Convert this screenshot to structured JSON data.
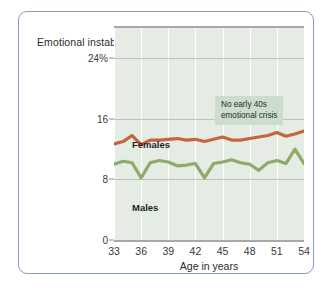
{
  "chart_data": {
    "type": "line",
    "title": "",
    "ylabel": "Emotional\ninstability",
    "xlabel": "Age in years",
    "xlim": [
      33,
      54
    ],
    "ylim": [
      0,
      28
    ],
    "yticks": [
      0,
      8,
      16,
      24
    ],
    "ytick_labels": [
      "0",
      "8",
      "16",
      "24%"
    ],
    "xticks": [
      33,
      36,
      39,
      42,
      45,
      48,
      51,
      54
    ],
    "xtick_labels": [
      "33",
      "36",
      "39",
      "42",
      "45",
      "48",
      "51",
      "54"
    ],
    "grid": "vertical-white-and-horizontal",
    "legend_position": "inline-labels",
    "annotations": [
      {
        "text": "No early 40s\nemotional crisis",
        "x": 46.5,
        "y": 21
      }
    ],
    "x": [
      33,
      34,
      35,
      36,
      37,
      38,
      39,
      40,
      41,
      42,
      43,
      44,
      45,
      46,
      47,
      48,
      49,
      50,
      51,
      52,
      53,
      54
    ],
    "series": [
      {
        "name": "Females",
        "color": "#c4653f",
        "values": [
          12.7,
          13.0,
          13.8,
          12.6,
          13.2,
          13.2,
          13.3,
          13.4,
          13.2,
          13.3,
          13.0,
          13.3,
          13.6,
          13.2,
          13.2,
          13.4,
          13.6,
          13.8,
          14.2,
          13.7,
          14.0,
          14.4
        ]
      },
      {
        "name": "Males",
        "color": "#8faa6b",
        "values": [
          10.0,
          10.4,
          10.2,
          8.2,
          10.2,
          10.5,
          10.3,
          9.8,
          9.9,
          10.1,
          8.2,
          10.1,
          10.3,
          10.6,
          10.2,
          10.0,
          9.2,
          10.2,
          10.5,
          10.1,
          12.0,
          10.1
        ]
      }
    ]
  },
  "axis": {
    "y_title": "Emotional\ninstability",
    "x_title": "Age in years"
  },
  "labels": {
    "females": "Females",
    "males": "Males"
  },
  "annotation": {
    "text": "No early 40s\nemotional crisis"
  }
}
